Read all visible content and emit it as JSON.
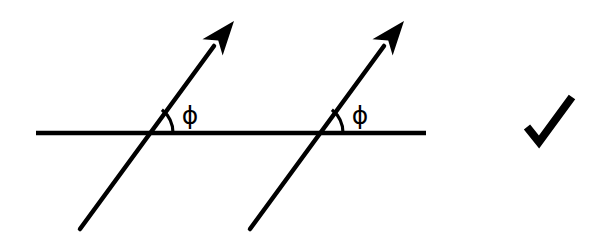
{
  "figure": {
    "background_color": "#ffffff",
    "stroke_color": "#000000",
    "width": 600,
    "height": 237
  },
  "reference_line": {
    "name": "horizontal-reference-line",
    "x1": 36,
    "y1": 133,
    "x2": 426,
    "y2": 133,
    "stroke_width": 4.5
  },
  "rays": [
    {
      "id": "ray-1",
      "label": "ϕ",
      "label_x": 190,
      "label_y": 124,
      "tail_x": 80,
      "tail_y": 229,
      "crossing_x": 143,
      "crossing_y": 133,
      "tip_x": 234,
      "tip_y": 21,
      "shaft_end_x": 214,
      "shaft_end_y": 46,
      "angle_degrees": 51,
      "arc_radius": 30,
      "stroke_width": 4.5
    },
    {
      "id": "ray-2",
      "label": "ϕ",
      "label_x": 360,
      "label_y": 124,
      "tail_x": 250,
      "tail_y": 229,
      "crossing_x": 313,
      "crossing_y": 133,
      "tip_x": 404,
      "tip_y": 21,
      "shaft_end_x": 384,
      "shaft_end_y": 46,
      "angle_degrees": 51,
      "arc_radius": 30,
      "stroke_width": 4.5
    }
  ],
  "checkmark": {
    "name": "checkmark",
    "start_x": 527,
    "start_y": 127,
    "vertex_x": 539,
    "vertex_y": 142,
    "end_x": 572,
    "end_y": 97,
    "stroke_width": 8
  },
  "arrowhead": {
    "length": 34,
    "half_width": 13,
    "notch": 9
  }
}
